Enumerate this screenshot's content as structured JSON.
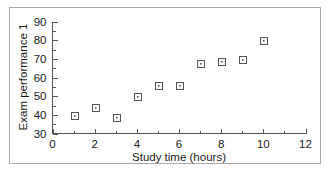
{
  "chart_data": {
    "type": "scatter",
    "title": "",
    "xlabel": "Study time (hours)",
    "ylabel": "Exam performance 1",
    "xlim": [
      0,
      12
    ],
    "ylim": [
      30,
      90
    ],
    "xticks": [
      0,
      2,
      4,
      6,
      8,
      10,
      12
    ],
    "xtick_labels": [
      "0",
      "2",
      "4",
      "6",
      "8",
      "10",
      "12"
    ],
    "xminor_ticks": [
      1,
      3,
      5,
      7,
      9,
      11
    ],
    "yticks": [
      30,
      40,
      50,
      60,
      70,
      80,
      90
    ],
    "ytick_labels": [
      "30",
      "40",
      "50",
      "60",
      "70",
      "80",
      "90"
    ],
    "yminor_ticks": [
      35,
      45,
      55,
      65,
      75,
      85
    ],
    "grid": false,
    "legend": false,
    "marker": "open-square-with-center-dot",
    "marker_color": "#555555",
    "points": [
      {
        "x": 1,
        "y": 40
      },
      {
        "x": 2,
        "y": 44
      },
      {
        "x": 3,
        "y": 39
      },
      {
        "x": 4,
        "y": 50
      },
      {
        "x": 5,
        "y": 56
      },
      {
        "x": 6,
        "y": 56
      },
      {
        "x": 7,
        "y": 68
      },
      {
        "x": 8,
        "y": 69
      },
      {
        "x": 9,
        "y": 70
      },
      {
        "x": 10,
        "y": 80
      }
    ],
    "series": [
      {
        "name": "Exam performance 1",
        "x": [
          1,
          2,
          3,
          4,
          5,
          6,
          7,
          8,
          9,
          10
        ],
        "values": [
          40,
          44,
          39,
          50,
          56,
          56,
          68,
          69,
          70,
          80
        ]
      }
    ]
  },
  "figure": {
    "frame_color": "#a8a8a8",
    "axis_color": "#555555",
    "background": "#ffffff"
  }
}
